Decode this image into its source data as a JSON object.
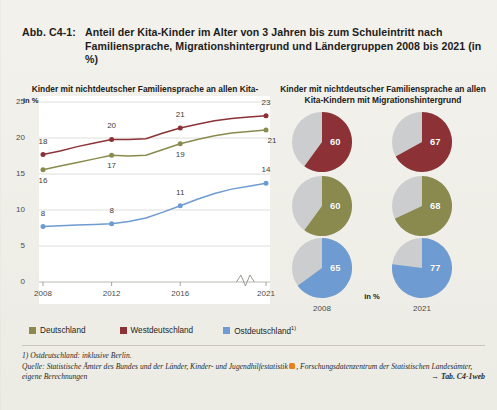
{
  "figure": {
    "number": "Abb. C4-1:",
    "title": "Anteil der Kita-Kinder im Alter von 3 Jahren bis zum Schuleintritt nach Familiensprache, Migrationshintergrund und Ländergruppen 2008 bis 2021 (in %)"
  },
  "colors": {
    "deutschland": "#8a8a4e",
    "westdeutschland": "#8c3236",
    "ostdeutschland": "#6e9bd1",
    "pie_rest": "#cbcdce",
    "page_bg": "#efeee7",
    "plot_bg": "#ffffff",
    "grid": "#d6d6d0",
    "badge_orange": "#e8801e"
  },
  "legend": {
    "items": [
      {
        "label": "Deutschland",
        "sup": "",
        "color_key": "deutschland"
      },
      {
        "label": "Westdeutschland",
        "sup": "",
        "color_key": "westdeutschland"
      },
      {
        "label": "Ostdeutschland",
        "sup": "1)",
        "color_key": "ostdeutschland"
      }
    ]
  },
  "footnotes": {
    "note": "1) Ostdeutschland: inklusive Berlin.",
    "source_part1": "Quelle: Statistische Ämter des Bundes und der Länder, Kinder- und Jugendhilfestatistik",
    "source_badge": "data-icon",
    "source_part2": ", Forschungsdatenzentrum der Statistischen Landesämter, eigene Berechnungen",
    "table_ref": "→ Tab. C4-1web"
  },
  "chart_data": [
    {
      "type": "line",
      "id": "line-chart",
      "title": "Kinder mit nichtdeutscher Familiensprache an allen Kita-Kindern",
      "ylabel": "in %",
      "xlabel": "",
      "ylim": [
        0,
        25
      ],
      "yticks": [
        0,
        5,
        10,
        15,
        20,
        25
      ],
      "grid": true,
      "axis_break": true,
      "axis_break_between": [
        "2016",
        "2021"
      ],
      "x": [
        2008,
        2009,
        2010,
        2011,
        2012,
        2013,
        2014,
        2015,
        2016,
        2017,
        2018,
        2019,
        2020,
        2021
      ],
      "xticks": [
        "2008",
        "2012",
        "2016",
        "2021"
      ],
      "label_years": [
        2008,
        2012,
        2016,
        2021
      ],
      "series": [
        {
          "name": "Westdeutschland",
          "color_key": "westdeutschland",
          "values": [
            17.7,
            18.2,
            18.8,
            19.3,
            19.8,
            19.8,
            19.9,
            20.7,
            21.4,
            21.9,
            22.4,
            22.7,
            22.9,
            23.1
          ],
          "labels": {
            "2008": "18",
            "2012": "20",
            "2016": "21",
            "2021": "23"
          }
        },
        {
          "name": "Deutschland",
          "color_key": "deutschland",
          "values": [
            15.6,
            16.1,
            16.6,
            17.1,
            17.6,
            17.5,
            17.6,
            18.4,
            19.2,
            19.8,
            20.3,
            20.7,
            20.9,
            21.1
          ],
          "labels": {
            "2008": "16",
            "2012": "17",
            "2016": "19",
            "2021": "21"
          }
        },
        {
          "name": "Ostdeutschland",
          "color_key": "ostdeutschland",
          "values": [
            7.7,
            7.8,
            7.9,
            8.0,
            8.1,
            8.4,
            8.9,
            9.7,
            10.6,
            11.5,
            12.3,
            12.9,
            13.3,
            13.7
          ],
          "labels": {
            "2008": "8",
            "2012": "8",
            "2016": "11",
            "2021": "14"
          }
        }
      ]
    },
    {
      "type": "pie",
      "id": "pie-grid",
      "title": "Kinder mit nichtdeutscher Familiensprache an allen Kita-Kindern mit Migrationshintergrund",
      "unit_label": "in %",
      "columns": [
        "2008",
        "2021"
      ],
      "rows": [
        {
          "name": "Westdeutschland",
          "color_key": "westdeutschland",
          "values": [
            60,
            67
          ]
        },
        {
          "name": "Deutschland",
          "color_key": "deutschland",
          "values": [
            60,
            68
          ]
        },
        {
          "name": "Ostdeutschland",
          "color_key": "ostdeutschland",
          "values": [
            65,
            77
          ]
        }
      ],
      "rest_color_key": "pie_rest"
    }
  ]
}
